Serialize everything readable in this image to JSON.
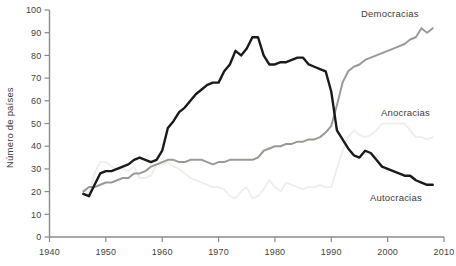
{
  "chart_data": {
    "type": "line",
    "title": "",
    "xlabel": "",
    "ylabel": "Número de países",
    "xlim": [
      1940,
      2010
    ],
    "ylim": [
      0,
      100
    ],
    "grid": false,
    "legend_position": "inline-right",
    "xticks": [
      "1940",
      "1950",
      "1960",
      "1970",
      "1980",
      "1990",
      "2000",
      "2010"
    ],
    "yticks": [
      "0",
      "10",
      "20",
      "30",
      "40",
      "50",
      "60",
      "70",
      "80",
      "90",
      "100"
    ],
    "x": [
      1946,
      1947,
      1948,
      1949,
      1950,
      1951,
      1952,
      1953,
      1954,
      1955,
      1956,
      1957,
      1958,
      1959,
      1960,
      1961,
      1962,
      1963,
      1964,
      1965,
      1966,
      1967,
      1968,
      1969,
      1970,
      1971,
      1972,
      1973,
      1974,
      1975,
      1976,
      1977,
      1978,
      1979,
      1980,
      1981,
      1982,
      1983,
      1984,
      1985,
      1986,
      1987,
      1988,
      1989,
      1990,
      1991,
      1992,
      1993,
      1994,
      1995,
      1996,
      1997,
      1998,
      1999,
      2000,
      2001,
      2002,
      2003,
      2004,
      2005,
      2006,
      2007,
      2008
    ],
    "series": [
      {
        "name": "Autocracias",
        "color": "#1a1a1a",
        "values": [
          19,
          18,
          23,
          28,
          29,
          29,
          30,
          31,
          32,
          34,
          35,
          34,
          33,
          34,
          38,
          48,
          51,
          55,
          57,
          60,
          63,
          65,
          67,
          68,
          68,
          73,
          76,
          82,
          80,
          83,
          88,
          88,
          80,
          76,
          76,
          77,
          77,
          78,
          79,
          79,
          76,
          75,
          74,
          73,
          64,
          47,
          43,
          39,
          36,
          35,
          38,
          37,
          34,
          31,
          30,
          29,
          28,
          27,
          27,
          25,
          24,
          23,
          23
        ]
      },
      {
        "name": "Democracias",
        "color": "#9a9a94",
        "values": [
          20,
          22,
          22,
          23,
          24,
          24,
          25,
          26,
          26,
          28,
          28,
          29,
          31,
          32,
          33,
          34,
          34,
          33,
          33,
          34,
          34,
          34,
          33,
          32,
          33,
          33,
          34,
          34,
          34,
          34,
          34,
          35,
          38,
          39,
          40,
          40,
          41,
          41,
          42,
          42,
          43,
          43,
          44,
          46,
          49,
          58,
          68,
          73,
          75,
          76,
          78,
          79,
          80,
          81,
          82,
          83,
          84,
          85,
          87,
          88,
          92,
          90,
          92
        ]
      },
      {
        "name": "Anocracias",
        "color": "#efeee8",
        "values": [
          21,
          19,
          28,
          33,
          33,
          31,
          30,
          30,
          29,
          31,
          26,
          26,
          27,
          32,
          32,
          33,
          31,
          30,
          28,
          26,
          25,
          24,
          23,
          22,
          22,
          21,
          18,
          17,
          20,
          22,
          17,
          18,
          21,
          25,
          22,
          20,
          24,
          23,
          22,
          21,
          22,
          22,
          23,
          22,
          22,
          30,
          38,
          44,
          47,
          45,
          44,
          45,
          47,
          50,
          50,
          50,
          50,
          50,
          47,
          44,
          44,
          43,
          44
        ]
      }
    ]
  },
  "axis": {
    "y_title": "Número de países"
  },
  "labels": {
    "democracias": "Democracias",
    "anocracias": "Anocracias",
    "autocracias": "Autocracias"
  }
}
